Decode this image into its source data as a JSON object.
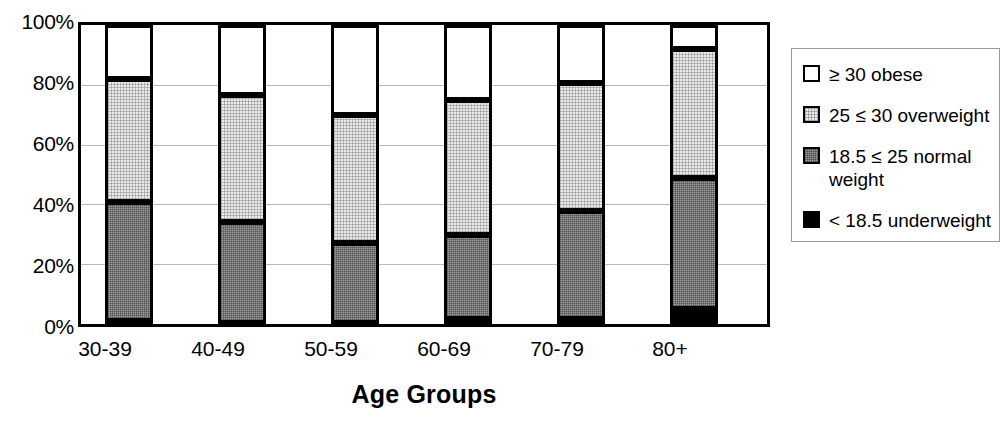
{
  "chart_data": {
    "type": "bar",
    "subtype": "stacked-bar-100-percent",
    "title": "",
    "xlabel": "Age Groups",
    "ylabel": "",
    "categories": [
      "30-39",
      "40-49",
      "50-59",
      "60-69",
      "70-79",
      "80+"
    ],
    "ylim": [
      0,
      100
    ],
    "yticks": [
      0,
      20,
      40,
      60,
      80,
      100
    ],
    "ytick_labels": [
      "0%",
      "20%",
      "40%",
      "60%",
      "80%",
      "100%"
    ],
    "grid": true,
    "grid_axis": "y",
    "legend_position": "right-outside",
    "stack_order_bottom_to_top": [
      "< 18.5 underweight",
      "18.5 ≤ 25 normal weight",
      "25 ≤ 30 overweight",
      "≥ 30 obese"
    ],
    "series": [
      {
        "name": "< 18.5 underweight",
        "color": "#000000",
        "values": [
          1.0,
          0.5,
          0.5,
          1.7,
          1.7,
          5.0
        ]
      },
      {
        "name": "18.5 ≤ 25 normal weight",
        "color": "#9d9d9d",
        "values": [
          39.7,
          33.5,
          26.5,
          28.0,
          36.0,
          44.0
        ]
      },
      {
        "name": "25 ≤ 30 overweight",
        "color": "#ebebeb",
        "values": [
          41.3,
          42.5,
          43.0,
          45.3,
          42.8,
          43.0
        ]
      },
      {
        "name": "≥ 30 obese",
        "color": "#ffffff",
        "values": [
          18.0,
          23.5,
          30.0,
          25.0,
          19.5,
          8.0
        ]
      }
    ],
    "cumulative_tops": [
      {
        "category": "30-39",
        "underweight": 1.0,
        "normal": 40.7,
        "overweight": 82.0,
        "obese": 100
      },
      {
        "category": "40-49",
        "underweight": 0.5,
        "normal": 34.0,
        "overweight": 76.5,
        "obese": 100
      },
      {
        "category": "50-59",
        "underweight": 0.5,
        "normal": 27.0,
        "overweight": 70.0,
        "obese": 100
      },
      {
        "category": "60-69",
        "underweight": 1.7,
        "normal": 29.7,
        "overweight": 75.0,
        "obese": 100
      },
      {
        "category": "70-79",
        "underweight": 1.7,
        "normal": 37.7,
        "overweight": 80.5,
        "obese": 100
      },
      {
        "category": "80+",
        "underweight": 5.0,
        "normal": 49.0,
        "overweight": 92.0,
        "obese": 100
      }
    ]
  },
  "axes": {
    "x_title": "Age Groups",
    "y_ticks": [
      "100%",
      "80%",
      "60%",
      "40%",
      "20%",
      "0%"
    ],
    "x_ticks": [
      "30-39",
      "40-49",
      "50-59",
      "60-69",
      "70-79",
      "80+"
    ]
  },
  "legend": {
    "items": [
      {
        "label": "≥ 30 obese",
        "swatch": "obese"
      },
      {
        "label": "25 ≤ 30 overweight",
        "swatch": "overweight"
      },
      {
        "label": "18.5 ≤ 25 normal\n          weight",
        "swatch": "normal"
      },
      {
        "label": "< 18.5 underweight",
        "swatch": "underweight"
      }
    ]
  }
}
